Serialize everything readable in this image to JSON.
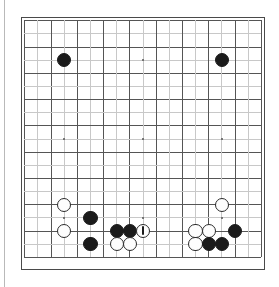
{
  "figure": {
    "kind": "go-board-diagram",
    "board_size": 19,
    "background_color": "#ffffff",
    "border_color": "#4a4a4a",
    "grid_color": "#555555",
    "grid_color_light": "#c8c8c8",
    "black_stone_color": "#1b1b1b",
    "white_stone_color": "#fdfdfd",
    "white_stone_border": "#2b2b2b",
    "marker_color": "#1b1b1b",
    "left_rule_color": "#b9b9b9"
  },
  "board": {
    "origin_x": 3.2,
    "origin_y": 3.2,
    "cell": 13.15,
    "stone_diameter": 14.4,
    "star_size": 2.6,
    "star_points": [
      {
        "col": 3,
        "row": 3
      },
      {
        "col": 9,
        "row": 3
      },
      {
        "col": 15,
        "row": 3
      },
      {
        "col": 3,
        "row": 9
      },
      {
        "col": 9,
        "row": 9
      },
      {
        "col": 15,
        "row": 9
      },
      {
        "col": 3,
        "row": 15
      },
      {
        "col": 9,
        "row": 15
      },
      {
        "col": 15,
        "row": 15
      }
    ],
    "stones": [
      {
        "color": "black",
        "col": 3,
        "row": 3,
        "marked": false
      },
      {
        "color": "black",
        "col": 15,
        "row": 3,
        "marked": false
      },
      {
        "color": "white",
        "col": 3,
        "row": 14,
        "marked": false
      },
      {
        "color": "white",
        "col": 3,
        "row": 16,
        "marked": false
      },
      {
        "color": "black",
        "col": 5,
        "row": 15,
        "marked": false
      },
      {
        "color": "black",
        "col": 5,
        "row": 17,
        "marked": false
      },
      {
        "color": "black",
        "col": 7,
        "row": 16,
        "marked": false
      },
      {
        "color": "black",
        "col": 8,
        "row": 16,
        "marked": false
      },
      {
        "color": "white",
        "col": 9,
        "row": 16,
        "marked": true
      },
      {
        "color": "white",
        "col": 7,
        "row": 17,
        "marked": false
      },
      {
        "color": "white",
        "col": 8,
        "row": 17,
        "marked": false
      },
      {
        "color": "white",
        "col": 15,
        "row": 14,
        "marked": false
      },
      {
        "color": "white",
        "col": 13,
        "row": 16,
        "marked": false
      },
      {
        "color": "white",
        "col": 14,
        "row": 16,
        "marked": false
      },
      {
        "color": "black",
        "col": 16,
        "row": 16,
        "marked": false
      },
      {
        "color": "white",
        "col": 13,
        "row": 17,
        "marked": false
      },
      {
        "color": "black",
        "col": 14,
        "row": 17,
        "marked": false
      },
      {
        "color": "black",
        "col": 15,
        "row": 17,
        "marked": false
      }
    ]
  }
}
